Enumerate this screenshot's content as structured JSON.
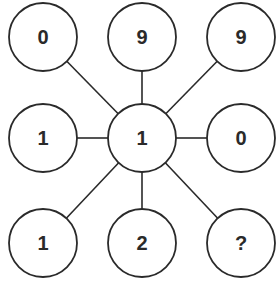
{
  "diagram": {
    "type": "number-puzzle-star",
    "stroke_color": "#2a2a2a",
    "background": "#ffffff",
    "center": {
      "id": "c",
      "label": "1",
      "cx": 142,
      "cy": 138
    },
    "nodes": [
      {
        "id": "tl",
        "label": "0",
        "cx": 43,
        "cy": 37
      },
      {
        "id": "tc",
        "label": "9",
        "cx": 142,
        "cy": 37
      },
      {
        "id": "tr",
        "label": "9",
        "cx": 241,
        "cy": 37
      },
      {
        "id": "ml",
        "label": "1",
        "cx": 43,
        "cy": 138
      },
      {
        "id": "mr",
        "label": "0",
        "cx": 241,
        "cy": 138
      },
      {
        "id": "bl",
        "label": "1",
        "cx": 43,
        "cy": 243
      },
      {
        "id": "bc",
        "label": "2",
        "cx": 142,
        "cy": 243
      },
      {
        "id": "br",
        "label": "?",
        "cx": 241,
        "cy": 243
      }
    ],
    "radius": 34
  }
}
